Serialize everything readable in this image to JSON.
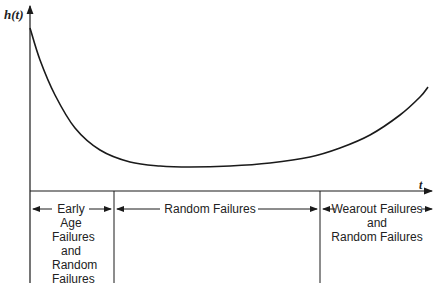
{
  "chart_data": {
    "type": "line",
    "title": "",
    "ylabel": "h(t)",
    "xlabel": "t",
    "curve_points_px": [
      [
        30,
        28
      ],
      [
        40,
        60
      ],
      [
        55,
        95
      ],
      [
        75,
        128
      ],
      [
        100,
        150
      ],
      [
        130,
        162
      ],
      [
        160,
        166
      ],
      [
        190,
        167
      ],
      [
        230,
        166
      ],
      [
        270,
        163
      ],
      [
        310,
        157
      ],
      [
        340,
        148
      ],
      [
        370,
        135
      ],
      [
        400,
        115
      ],
      [
        420,
        97
      ],
      [
        428,
        87
      ]
    ],
    "regions": [
      {
        "name": "early",
        "label_lines": [
          "Early",
          "Age",
          "Failures",
          "and",
          "Random",
          "Failures"
        ]
      },
      {
        "name": "random",
        "label_lines": [
          "Random Failures"
        ]
      },
      {
        "name": "wearout",
        "label_lines": [
          "Wearout Failures",
          "and",
          "Random Failures"
        ]
      }
    ]
  },
  "axis": {
    "y_label": "h(t)",
    "x_label": "t"
  },
  "regions": {
    "early": [
      "Early",
      "Age",
      "Failures",
      "and",
      "Random",
      "Failures"
    ],
    "random": "Random Failures",
    "wearout": [
      "Wearout Failures",
      "and",
      "Random Failures"
    ]
  },
  "colors": {
    "line": "#1a1a1a",
    "text": "#222222"
  }
}
